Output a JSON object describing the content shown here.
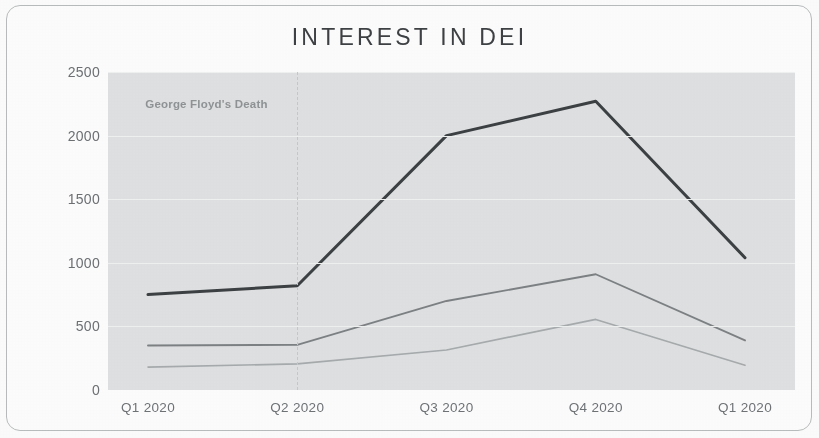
{
  "chart_data": {
    "type": "line",
    "title": "INTEREST IN DEI",
    "xlabel": "",
    "ylabel": "DEI Questions Asked",
    "categories": [
      "Q1 2020",
      "Q2 2020",
      "Q3 2020",
      "Q4 2020",
      "Q1 2020"
    ],
    "x_tick_labels": [
      "Q1 2020",
      "Q2 2020",
      "Q3 2020",
      "Q4 2020",
      "Q1 2020"
    ],
    "y_tick_labels": [
      "2500",
      "2000",
      "1500",
      "1000",
      "500",
      "0"
    ],
    "y_tick_values": [
      2500,
      2000,
      1500,
      1000,
      500,
      0
    ],
    "ylim": [
      0,
      2500
    ],
    "grid": true,
    "legend": "none",
    "series": [
      {
        "name": "series-1",
        "color": "#3c4043",
        "values": [
          750,
          820,
          2000,
          2270,
          1040
        ]
      },
      {
        "name": "series-2",
        "color": "#7d8184",
        "values": [
          350,
          355,
          700,
          910,
          390
        ]
      },
      {
        "name": "series-3",
        "color": "#a7abad",
        "values": [
          180,
          205,
          315,
          555,
          195
        ]
      }
    ],
    "annotations": [
      {
        "label": "George Floyd's Death",
        "at_category": "Q2 2020",
        "style": "vertical-dashed-line"
      }
    ],
    "colors": {
      "plot_background": "#dfe0e1",
      "gridline": "#eff0f0",
      "card_background": "#fcfcfc",
      "card_border": "#b9bcbd",
      "title_text": "#3e4144",
      "tick_text": "#6c7073",
      "annotation_text": "#8e9294"
    }
  }
}
